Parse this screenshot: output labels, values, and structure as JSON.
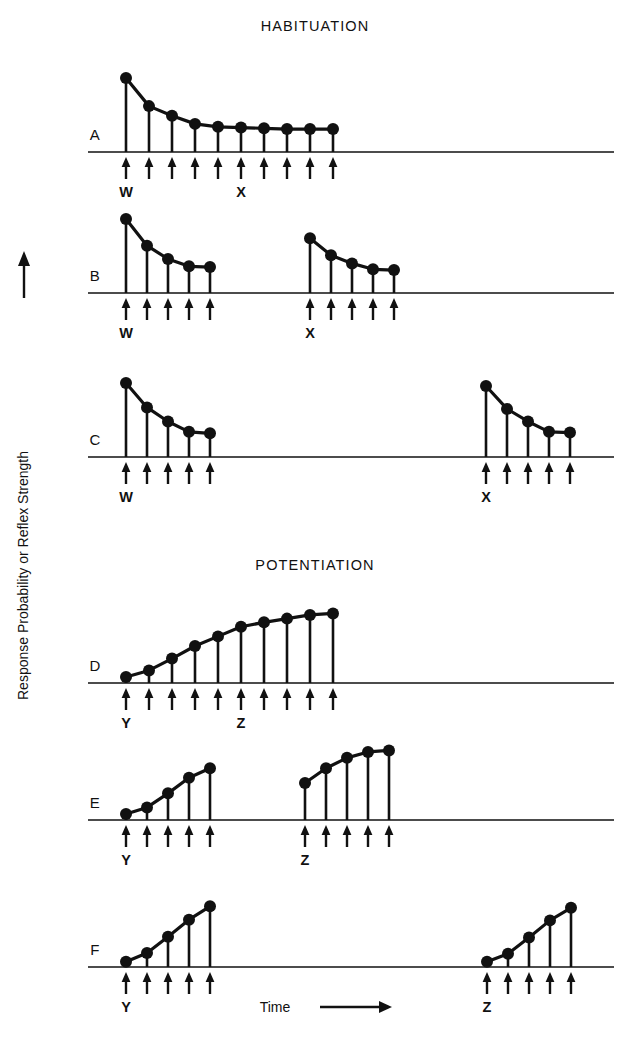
{
  "figure": {
    "width": 630,
    "height": 1044,
    "background_color": "#ffffff",
    "ink_color": "#111111",
    "y_axis_label": "Response Probability or Reflex Strength",
    "x_axis_label": "Time",
    "y_axis_arrow": "up-arrow",
    "x_axis_arrow": "right-arrow",
    "sections": [
      {
        "id": "habituation",
        "title": "HABITUATION",
        "title_x": 315,
        "title_y": 31
      },
      {
        "id": "potentiation",
        "title": "POTENTIATION",
        "title_x": 315,
        "title_y": 570
      }
    ]
  },
  "chart_data": {
    "type": "line",
    "subtitle": "",
    "xlabel": "Time",
    "ylabel": "Response Probability or Reflex Strength",
    "grid": false,
    "legend_position": "none",
    "axis_note": "Each panel shares a common horizontal baseline (zero response). Upward arrows below the baseline mark stimulus presentations. Filled circles connected by a line show the response magnitude for each stimulus.",
    "x_units": "stimulus presentation index (arbitrary time units)",
    "y_units": "arbitrary relative units, baseline = 0, maximum = 1.0",
    "panels": [
      {
        "label": "A",
        "section": "HABITUATION",
        "baseline_y": 152,
        "label_x": 95,
        "label_y": 140,
        "description": "Massed stimulation: one continuous series of ten closely spaced stimuli producing progressive response decrement.",
        "markers": [
          {
            "text": "W",
            "at_index": 0
          },
          {
            "text": "X",
            "at_index": 5
          }
        ],
        "groups": [
          {
            "start_x": 126,
            "spacing": 23,
            "n": 10,
            "values": [
              1.0,
              0.62,
              0.49,
              0.38,
              0.34,
              0.33,
              0.32,
              0.31,
              0.31,
              0.31
            ]
          }
        ]
      },
      {
        "label": "B",
        "section": "HABITUATION",
        "baseline_y": 293,
        "label_x": 95,
        "label_y": 281,
        "description": "Two series separated by a short rest interval; the second series begins below the original level, showing retention of habituation.",
        "markers": [
          {
            "text": "W",
            "group": 0,
            "at_index": 0
          },
          {
            "text": "X",
            "group": 1,
            "at_index": 0
          }
        ],
        "groups": [
          {
            "start_x": 126,
            "spacing": 21,
            "n": 5,
            "values": [
              1.0,
              0.64,
              0.46,
              0.36,
              0.35
            ]
          },
          {
            "start_x": 310,
            "spacing": 21,
            "n": 5,
            "values": [
              0.74,
              0.51,
              0.4,
              0.32,
              0.31
            ]
          }
        ]
      },
      {
        "label": "C",
        "section": "HABITUATION",
        "baseline_y": 457,
        "label_x": 95,
        "label_y": 445,
        "description": "Two series separated by a long rest interval; spontaneous recovery returns the response nearly to the original level.",
        "markers": [
          {
            "text": "W",
            "group": 0,
            "at_index": 0
          },
          {
            "text": "X",
            "group": 1,
            "at_index": 0
          }
        ],
        "groups": [
          {
            "start_x": 126,
            "spacing": 21,
            "n": 5,
            "values": [
              1.0,
              0.67,
              0.48,
              0.34,
              0.32
            ]
          },
          {
            "start_x": 486,
            "spacing": 21,
            "n": 5,
            "values": [
              0.96,
              0.65,
              0.48,
              0.34,
              0.33
            ]
          }
        ]
      },
      {
        "label": "D",
        "section": "POTENTIATION",
        "baseline_y": 683,
        "label_x": 95,
        "label_y": 671,
        "description": "Massed stimulation: one continuous series of ten stimuli producing progressive response increment to an asymptote.",
        "markers": [
          {
            "text": "Y",
            "at_index": 0
          },
          {
            "text": "Z",
            "at_index": 5
          }
        ],
        "groups": [
          {
            "start_x": 126,
            "spacing": 23,
            "n": 10,
            "values": [
              0.08,
              0.17,
              0.33,
              0.5,
              0.63,
              0.76,
              0.82,
              0.87,
              0.92,
              0.94
            ]
          }
        ]
      },
      {
        "label": "E",
        "section": "POTENTIATION",
        "baseline_y": 820,
        "label_x": 95,
        "label_y": 808,
        "description": "Two series separated by a short rest interval; the second series begins above the original starting level, showing retention of potentiation.",
        "markers": [
          {
            "text": "Y",
            "group": 0,
            "at_index": 0
          },
          {
            "text": "Z",
            "group": 1,
            "at_index": 0
          }
        ],
        "groups": [
          {
            "start_x": 126,
            "spacing": 21,
            "n": 5,
            "values": [
              0.08,
              0.17,
              0.36,
              0.57,
              0.7
            ]
          },
          {
            "start_x": 305,
            "spacing": 21,
            "n": 5,
            "values": [
              0.5,
              0.7,
              0.84,
              0.92,
              0.94
            ]
          }
        ]
      },
      {
        "label": "F",
        "section": "POTENTIATION",
        "baseline_y": 967,
        "label_x": 95,
        "label_y": 955,
        "description": "Two series separated by a long rest interval; the potentiation decays so the second series again starts at the original baseline level.",
        "markers": [
          {
            "text": "Y",
            "group": 0,
            "at_index": 0
          },
          {
            "text": "Z",
            "group": 1,
            "at_index": 0
          }
        ],
        "groups": [
          {
            "start_x": 126,
            "spacing": 21,
            "n": 5,
            "values": [
              0.07,
              0.19,
              0.41,
              0.64,
              0.82
            ]
          },
          {
            "start_x": 487,
            "spacing": 21,
            "n": 5,
            "values": [
              0.07,
              0.18,
              0.4,
              0.63,
              0.8
            ]
          }
        ]
      }
    ]
  },
  "geometry": {
    "baseline_x_start": 88,
    "baseline_x_end": 614,
    "max_amplitude_px": 74,
    "dot_radius": 6.0,
    "arrow_gap": 6,
    "arrow_length": 21,
    "marker_label_offset": 26,
    "ylabel_x": 28,
    "ylabel_baseline_y": 700,
    "ylabel_arrow_top": 250,
    "xlabel_x": 275,
    "xlabel_y": 1012,
    "xlabel_arrow_x1": 320,
    "xlabel_arrow_x2": 392
  }
}
